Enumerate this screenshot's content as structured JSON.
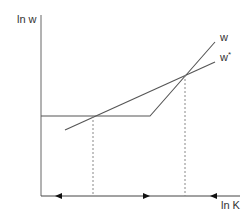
{
  "diagram": {
    "y_axis_label": "ln w",
    "x_axis_label": "ln K",
    "curves": [
      {
        "name": "w",
        "label": "w",
        "description": "flat segment then steep rising line"
      },
      {
        "name": "w_star",
        "label": "w",
        "label_superscript": "*",
        "description": "straight line with moderate slope"
      }
    ],
    "markers": {
      "dashed_verticals": 2,
      "arrows": [
        "left",
        "right",
        "left"
      ]
    },
    "colors": {
      "line": "#555555",
      "axis": "#666666",
      "dashed": "#888888",
      "arrow": "#111111",
      "text": "#333333"
    }
  }
}
